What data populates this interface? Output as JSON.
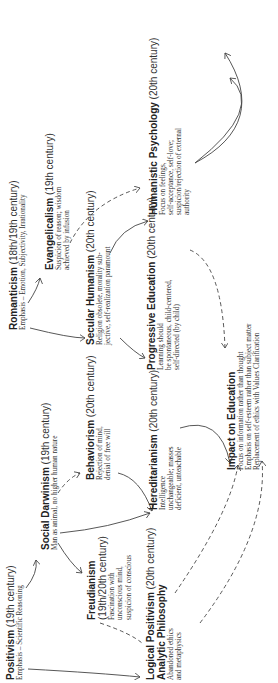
{
  "diagram": {
    "orientation": "rotated 90 degrees counter-clockwise",
    "nodes": [
      {
        "id": "positivism",
        "name": "Positivism",
        "era": "(19th century)",
        "desc": [
          "Emphasis – Scientific Reasoning"
        ]
      },
      {
        "id": "social_darwinism",
        "name": "Social Darwinism",
        "era": "(19th century)",
        "desc": [
          "Man as animal, no higher human nature"
        ]
      },
      {
        "id": "romanticism",
        "name": "Romanticism",
        "era": "(18th/19th century)",
        "desc": [
          "Emphasis – Emotion, Subjectivity, Irrationality"
        ]
      },
      {
        "id": "evangelicalism",
        "name": "Evangelicalism",
        "era": "(19th century)",
        "desc": [
          "Suspicion of reason; wisdom",
          "achieved by infusion"
        ]
      },
      {
        "id": "secular_humanism",
        "name": "Secular Humanism",
        "era": "(20th century)",
        "desc": [
          "Religion obsolete, morality sub-",
          "jective, self-realization paramount"
        ]
      },
      {
        "id": "freudianism",
        "name": "Freudianism",
        "era": "(19th/20th century)",
        "desc": [
          "Fascination with",
          "unconscious mind,",
          "suspicion of conscious"
        ]
      },
      {
        "id": "behaviorism",
        "name": "Behaviorism",
        "era": "(20th century)",
        "desc": [
          "Rejection of mind,",
          "denial of free will"
        ]
      },
      {
        "id": "logical_positivism",
        "name": "Logical Positivism",
        "era": "(20th century)",
        "name2": "Analytic Philosophy",
        "desc": [
          "Abandoned ethics",
          "and metaphysics"
        ]
      },
      {
        "id": "hereditarianism",
        "name": "Hereditarianism",
        "era": "(20th century)",
        "desc": [
          "Intelligence",
          "unchangeable; masses",
          "deficient, unteachable"
        ]
      },
      {
        "id": "progressive_education",
        "name": "Progressive Education",
        "era": "(20th century)",
        "desc": [
          "Learning should",
          "be spontaneous, child-centered,",
          "self-directed (by child)"
        ]
      },
      {
        "id": "humanistic_psychology",
        "name": "Humanistic Psychology",
        "era": "(20th century)",
        "desc": [
          "Focus on feelings,",
          "self-acceptance, self-love;",
          "suspicion/rejection of external",
          "authority"
        ]
      },
      {
        "id": "impact_education",
        "name": "Impact on Education",
        "era": "",
        "desc": [
          "Focus on information rather than thought",
          "Emphasis on self-esteem rather than subject matter",
          "Replacement of ethics with Values Clarification"
        ]
      }
    ],
    "colors": {
      "line": "#444444",
      "text": "#222222",
      "background": "#ffffff"
    }
  }
}
